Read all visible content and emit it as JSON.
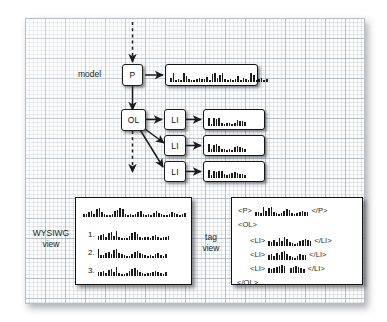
{
  "figure": {
    "kind": "document-model-diagram",
    "background": "#ffffff",
    "canvas_color": "#fdfdfd",
    "grid_color": "#96a0aa",
    "ink_color": "#1b1b1b"
  },
  "labels": {
    "model": "model",
    "wysiwyg_line1": "WYSIWG",
    "wysiwyg_line2": "view",
    "tag_line1": "tag",
    "tag_line2": "view"
  },
  "nodes": {
    "p": "P",
    "ol": "OL",
    "li1": "LI",
    "li2": "LI",
    "li3": "LI"
  },
  "list_markers": {
    "one": "1.",
    "two": "2.",
    "three": "3."
  },
  "tags": {
    "p_open": "<P>",
    "p_close": "</P>",
    "ol_open": "<OL>",
    "ol_close": "</OL>",
    "li_open": "<LI>",
    "li_close": "</LI>"
  },
  "text_runs": {
    "p_content": [
      4,
      9,
      2,
      3,
      2,
      9,
      6,
      3,
      2,
      2,
      3,
      4,
      3,
      3,
      5,
      2,
      8,
      9,
      4,
      7,
      9,
      3,
      2,
      3,
      2,
      3,
      6,
      2,
      4,
      3,
      2,
      9,
      7,
      2,
      3,
      4,
      2,
      3
    ],
    "li1_content": [
      8,
      2,
      8,
      7,
      8,
      3,
      2,
      3,
      3,
      2,
      3,
      6,
      5,
      5,
      4
    ],
    "li2_content": [
      8,
      3,
      7,
      8,
      6,
      3,
      3,
      2,
      3,
      2,
      5,
      6,
      5,
      4,
      3
    ],
    "li3_content": [
      8,
      3,
      7,
      6,
      7,
      7,
      4,
      3,
      4,
      5,
      6,
      5,
      4,
      4,
      3
    ],
    "wysiwyg_paragraph": [
      3,
      3,
      5,
      6,
      3,
      8,
      9,
      5,
      3,
      2,
      2,
      3,
      6,
      7,
      9,
      8,
      3,
      2,
      3,
      2,
      3,
      5,
      6,
      3,
      2,
      3,
      2,
      4,
      6,
      4,
      3,
      2,
      2,
      3,
      5,
      4,
      3,
      2,
      3,
      4
    ],
    "wysiwyg_item1": [
      4,
      5,
      6,
      3,
      7,
      8,
      4,
      9,
      3,
      2,
      2,
      2,
      4,
      7,
      8,
      6,
      3,
      2,
      3,
      3,
      2,
      4,
      5,
      3,
      2,
      3,
      3,
      4
    ],
    "wysiwyg_item2": [
      9,
      3,
      3,
      5,
      6,
      4,
      8,
      9,
      5,
      4,
      3,
      2,
      2,
      4,
      6,
      7,
      5,
      4,
      3,
      2,
      3,
      2,
      4,
      5,
      3,
      2,
      4
    ],
    "wysiwyg_item3": [
      4,
      4,
      5,
      3,
      6,
      7,
      4,
      9,
      3,
      2,
      2,
      3,
      5,
      7,
      8,
      6,
      4,
      3,
      2,
      3,
      3,
      4,
      5,
      4,
      3,
      2,
      4
    ],
    "tag_p_content": [
      4,
      4,
      3,
      9,
      5,
      8,
      9,
      4,
      3,
      2,
      3,
      5,
      7,
      6,
      3,
      2,
      3,
      4,
      5,
      4,
      4
    ],
    "tag_li1_content": [
      5,
      4,
      6,
      4,
      8,
      5,
      9,
      7,
      4,
      3,
      2,
      3,
      5,
      6,
      7,
      6,
      5
    ],
    "tag_li2_content": [
      5,
      6,
      4,
      7,
      5,
      8,
      9,
      6,
      4,
      3,
      2,
      4,
      6,
      5,
      5
    ],
    "tag_li3_content": [
      5,
      4,
      5,
      6,
      7,
      8,
      7,
      0,
      5,
      6,
      7,
      6,
      5,
      4
    ],
    "tag_li3_gap_index": 7
  },
  "arrows": {
    "dashed_in": "dashed arrow entering P from top",
    "p_to_content": "arrow from P to paragraph content box",
    "p_to_ol": "arrow from P down to OL",
    "ol_to_li1": "arrow from OL to first LI",
    "ol_to_li2": "arrow from OL to second LI",
    "ol_to_li3": "arrow from OL to third LI",
    "li_to_content": "arrow from each LI to its content box",
    "dashed_out": "dashed arrow leaving OL downward"
  }
}
